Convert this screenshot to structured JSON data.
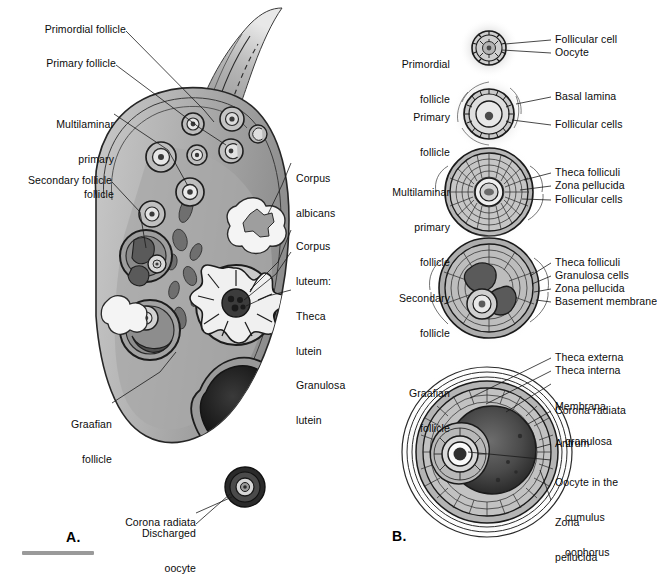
{
  "figure": {
    "panels": [
      {
        "id": "A",
        "letter": "A.",
        "caption": "Ovary cross-section"
      },
      {
        "id": "B",
        "letter": "B.",
        "caption": "Stages of follicular maturation"
      }
    ]
  },
  "colors": {
    "ink": "#0b0b0b",
    "leader": "#1a1a1a",
    "cortex_light": "#d8d8d8",
    "cortex_mid": "#b8b8b8",
    "stroma": "#9c9c9c",
    "stroma_dark": "#7b7b7b",
    "antrum_dark": "#1e1e1e",
    "corpus_albicans": "#f2f2f2",
    "scalebar": "#9a9a9a"
  },
  "panel_a": {
    "letter": "A.",
    "labels_left": [
      {
        "id": "primordial-follicle",
        "text": "Primordial follicle",
        "lines": [
          "Primordial follicle"
        ]
      },
      {
        "id": "primary-follicle",
        "text": "Primary follicle",
        "lines": [
          "Primary follicle"
        ]
      },
      {
        "id": "multilaminar-primary-follicle",
        "text": "Multilaminar primary follicle",
        "lines": [
          "Multilaminar",
          "primary",
          "follicle"
        ]
      },
      {
        "id": "secondary-follicle",
        "text": "Secondary follicle",
        "lines": [
          "Secondary follicle"
        ]
      },
      {
        "id": "graafian-follicle",
        "text": "Graafian follicle",
        "lines": [
          "Graafian",
          "follicle"
        ]
      }
    ],
    "labels_right": [
      {
        "id": "corpus-albicans",
        "text": "Corpus albicans",
        "lines": [
          "Corpus",
          "albicans"
        ]
      },
      {
        "id": "corpus-luteum",
        "text": "Corpus luteum: Theca lutein Granulosa lutein",
        "lines": [
          "Corpus",
          "luteum:",
          "Theca",
          "lutein",
          "Granulosa",
          "lutein"
        ]
      }
    ],
    "labels_bottom": [
      {
        "id": "discharged-oocyte",
        "text": "Discharged oocyte",
        "lines": [
          "Discharged",
          "oocyte"
        ]
      },
      {
        "id": "corona-radiata",
        "text": "Corona radiata",
        "lines": [
          "Corona radiata"
        ]
      }
    ]
  },
  "panel_b": {
    "letter": "B.",
    "stages": [
      {
        "id": "primordial-follicle",
        "name_lines": [
          "Primordial",
          "follicle"
        ],
        "callouts": [
          {
            "id": "follicular-cell",
            "text": "Follicular cell"
          },
          {
            "id": "oocyte",
            "text": "Oocyte"
          }
        ]
      },
      {
        "id": "primary-follicle",
        "name_lines": [
          "Primary",
          "follicle"
        ],
        "callouts": [
          {
            "id": "basal-lamina",
            "text": "Basal lamina"
          },
          {
            "id": "follicular-cells",
            "text": "Follicular cells"
          }
        ]
      },
      {
        "id": "multilaminar-primary-follicle",
        "name_lines": [
          "Multilaminar",
          "primary",
          "follicle"
        ],
        "callouts": [
          {
            "id": "theca-folliculi",
            "text": "Theca folliculi"
          },
          {
            "id": "zona-pellucida",
            "text": "Zona pellucida"
          },
          {
            "id": "follicular-cells",
            "text": "Follicular cells"
          }
        ]
      },
      {
        "id": "secondary-follicle",
        "name_lines": [
          "Secondary",
          "follicle"
        ],
        "callouts": [
          {
            "id": "theca-folliculi",
            "text": "Theca folliculi"
          },
          {
            "id": "granulosa-cells",
            "text": "Granulosa cells"
          },
          {
            "id": "zona-pellucida",
            "text": "Zona pellucida"
          },
          {
            "id": "basement-membrane",
            "text": "Basement membrane"
          }
        ]
      },
      {
        "id": "graafian-follicle",
        "name_lines": [
          "Graafian",
          "follicle"
        ],
        "callouts": [
          {
            "id": "theca-externa",
            "text": "Theca externa"
          },
          {
            "id": "theca-interna",
            "text": "Theca interna"
          },
          {
            "id": "membrana-granulosa",
            "text": "Membrana granulosa",
            "lines": [
              "Membrana",
              "granulosa"
            ]
          },
          {
            "id": "corona-radiata",
            "text": "Corona radiata"
          },
          {
            "id": "antrum",
            "text": "Antrum"
          },
          {
            "id": "oocyte-cumulus-oophorus",
            "text": "Oocyte in the cumulus oophorus",
            "lines": [
              "Oocyte in the",
              "cumulus",
              "oophorus"
            ]
          },
          {
            "id": "zona-pellucida",
            "text": "Zona pellucida",
            "lines": [
              "Zona",
              "pellucida"
            ]
          }
        ]
      }
    ]
  }
}
